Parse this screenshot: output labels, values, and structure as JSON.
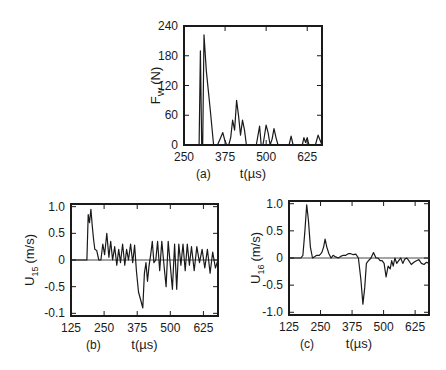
{
  "figure": {
    "panels": [
      {
        "id": "a",
        "label": "(a)"
      },
      {
        "id": "b",
        "label": "(b)"
      },
      {
        "id": "c",
        "label": "(c)"
      }
    ]
  },
  "chart_data": [
    {
      "panel": "(a)",
      "type": "line",
      "title": "",
      "xlabel": "t (µs)",
      "ylabel": "F_W (N)",
      "ylabel_main": "F",
      "ylabel_sub": "W",
      "ylabel_unit": "(N)",
      "xlim": [
        250,
        670
      ],
      "ylim": [
        0,
        240
      ],
      "xticks": [
        250,
        375,
        500,
        625
      ],
      "yticks": [
        0,
        60,
        120,
        180,
        240
      ],
      "grid": false,
      "legend": null,
      "series": [
        {
          "name": "F_W",
          "x": [
            250,
            296,
            300,
            304,
            307,
            311,
            318,
            330,
            340,
            352,
            360,
            368,
            374,
            380,
            386,
            392,
            398,
            404,
            410,
            416,
            422,
            428,
            434,
            440,
            470,
            480,
            485,
            490,
            493,
            500,
            506,
            512,
            518,
            524,
            530,
            536,
            542,
            548,
            560,
            570,
            576,
            582,
            610,
            615,
            620,
            625,
            630,
            640,
            650,
            658,
            665,
            670
          ],
          "y": [
            0,
            0,
            190,
            0,
            0,
            222,
            150,
            70,
            0,
            0,
            12,
            25,
            10,
            0,
            0,
            15,
            50,
            30,
            90,
            60,
            20,
            50,
            30,
            0,
            0,
            38,
            0,
            0,
            10,
            40,
            25,
            0,
            12,
            33,
            15,
            0,
            0,
            0,
            0,
            0,
            18,
            0,
            0,
            15,
            5,
            15,
            0,
            0,
            0,
            20,
            8,
            0
          ]
        }
      ]
    },
    {
      "panel": "(b)",
      "type": "line",
      "title": "",
      "xlabel": "t (µs)",
      "ylabel": "U_15 (m/s)",
      "ylabel_main": "U",
      "ylabel_sub": "15",
      "ylabel_unit": "(m/s)",
      "xlim": [
        125,
        680
      ],
      "ylim": [
        -1.05,
        1.05
      ],
      "xticks": [
        125,
        250,
        375,
        500,
        625
      ],
      "yticks": [
        1.0,
        0.5,
        0,
        -0.5,
        -1.0
      ],
      "ytick_labels": [
        "1.0",
        "0.5",
        "0",
        "-0.5",
        "-0.1"
      ],
      "grid": false,
      "zero_line": true,
      "legend": null,
      "series": [
        {
          "name": "U_15",
          "x": [
            125,
            185,
            190,
            195,
            200,
            205,
            210,
            215,
            222,
            230,
            238,
            245,
            252,
            260,
            268,
            275,
            282,
            290,
            298,
            305,
            312,
            320,
            328,
            335,
            342,
            350,
            358,
            365,
            372,
            380,
            388,
            396,
            402,
            408,
            414,
            420,
            426,
            432,
            438,
            445,
            452,
            460,
            468,
            476,
            484,
            492,
            500,
            508,
            516,
            524,
            532,
            540,
            548,
            556,
            564,
            572,
            580,
            590,
            600,
            610,
            620,
            630,
            640,
            650,
            660,
            670,
            680
          ],
          "y": [
            0,
            0,
            0.85,
            0.7,
            0.95,
            0.65,
            0.4,
            0.2,
            0.18,
            0.0,
            0.0,
            0.3,
            0.1,
            0.5,
            0.05,
            0.35,
            0.0,
            0.25,
            -0.1,
            0.2,
            -0.05,
            0.3,
            -0.1,
            0.2,
            0.0,
            0.3,
            -0.05,
            0.28,
            -0.2,
            -0.6,
            -0.75,
            -0.9,
            -0.25,
            -0.05,
            -0.4,
            -0.1,
            0.1,
            0.35,
            -0.05,
            0.0,
            0.35,
            -0.2,
            0.35,
            -0.1,
            -0.5,
            0.35,
            -0.1,
            -0.55,
            0.3,
            -0.55,
            0.3,
            -0.1,
            0.3,
            -0.2,
            0.3,
            -0.1,
            0.25,
            -0.2,
            0.25,
            -0.05,
            0.2,
            -0.15,
            0.2,
            -0.25,
            0.15,
            -0.15,
            0.0
          ]
        }
      ]
    },
    {
      "panel": "(c)",
      "type": "line",
      "title": "",
      "xlabel": "t (µs)",
      "ylabel": "U_16 (m/s)",
      "ylabel_main": "U",
      "ylabel_sub": "16",
      "ylabel_unit": "(m/s)",
      "xlim": [
        125,
        680
      ],
      "ylim": [
        -1.05,
        1.05
      ],
      "xticks": [
        125,
        250,
        375,
        500,
        625
      ],
      "yticks": [
        1.0,
        0.5,
        0,
        -0.5,
        -1.0
      ],
      "ytick_labels": [
        "1.0",
        "0.5",
        "0",
        "-0.5",
        "-1.0"
      ],
      "grid": false,
      "zero_line": true,
      "legend": null,
      "series": [
        {
          "name": "U_16",
          "x": [
            125,
            172,
            180,
            188,
            195,
            202,
            210,
            218,
            225,
            235,
            245,
            255,
            262,
            268,
            275,
            283,
            292,
            300,
            310,
            320,
            330,
            340,
            350,
            360,
            370,
            380,
            390,
            400,
            410,
            418,
            425,
            432,
            440,
            450,
            460,
            470,
            478,
            486,
            494,
            502,
            510,
            518,
            526,
            532,
            538,
            545,
            552,
            560,
            568,
            576,
            584,
            592,
            600,
            610,
            620,
            630,
            640,
            650,
            660,
            670,
            680
          ],
          "y": [
            0,
            0,
            0.05,
            0.5,
            0.98,
            0.7,
            0.2,
            0.0,
            0.02,
            0.05,
            0.05,
            0.1,
            0.2,
            0.35,
            0.2,
            0.08,
            0.0,
            0.05,
            0.02,
            0.0,
            0.03,
            0.05,
            0.05,
            0.08,
            0.08,
            0.06,
            0.07,
            0.0,
            -0.4,
            -0.85,
            -0.55,
            -0.1,
            -0.05,
            0.0,
            0.1,
            0.0,
            0.0,
            -0.05,
            -0.05,
            -0.1,
            -0.35,
            -0.15,
            -0.2,
            -0.05,
            -0.15,
            0.0,
            -0.1,
            -0.05,
            0.0,
            -0.1,
            -0.02,
            0.0,
            -0.05,
            -0.12,
            -0.08,
            -0.05,
            -0.03,
            -0.1,
            -0.12,
            -0.08,
            -0.1
          ]
        }
      ]
    }
  ]
}
